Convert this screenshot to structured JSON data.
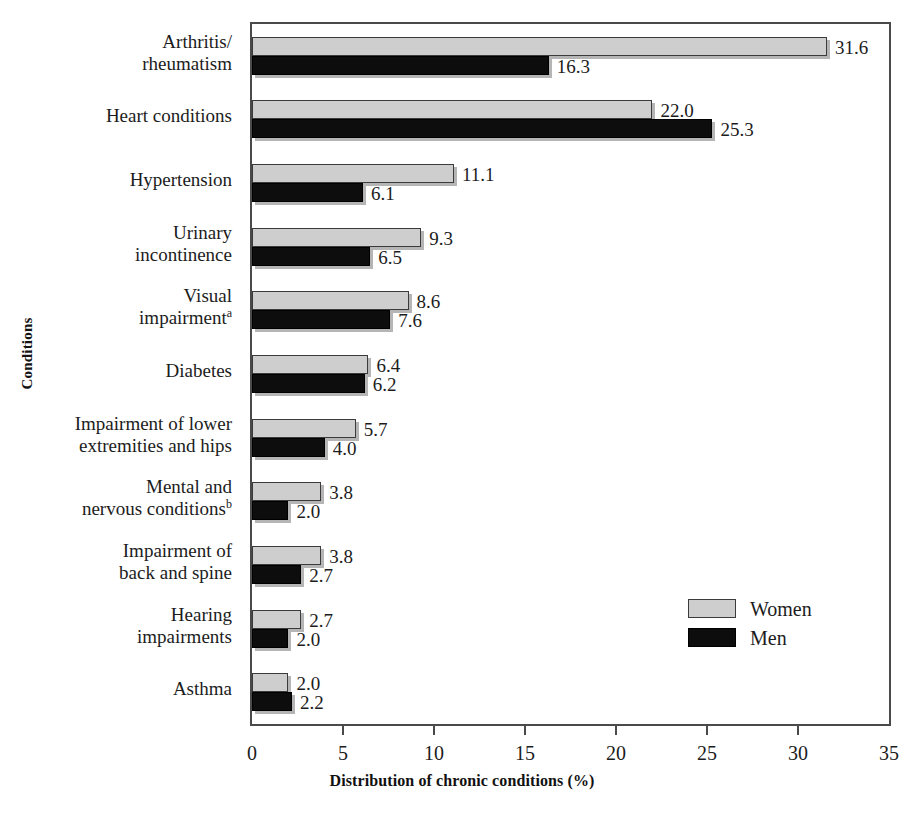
{
  "chart_data": {
    "type": "bar",
    "orientation": "horizontal",
    "title": "",
    "xlabel": "Distribution of chronic conditions (%)",
    "ylabel": "Conditions",
    "xlim": [
      0,
      35
    ],
    "xticks": [
      "0",
      "5",
      "10",
      "15",
      "20",
      "25",
      "30",
      "35"
    ],
    "grid": false,
    "legend_position": "middle-right",
    "categories": [
      "Arthritis/\nrheumatism",
      "Heart conditions",
      "Hypertension",
      "Urinary\nincontinence",
      "Visual\nimpairment",
      "Diabetes",
      "Impairment of lower\nextremities and hips",
      "Mental and\nnervous conditions",
      "Impairment of\nback and spine",
      "Hearing\nimpairments",
      "Asthma"
    ],
    "category_superscripts": [
      "",
      "",
      "",
      "",
      "a",
      "",
      "",
      "b",
      "",
      "",
      ""
    ],
    "series": [
      {
        "name": "Women",
        "color": "#cecece",
        "values": [
          31.6,
          22.0,
          11.1,
          9.3,
          8.6,
          6.4,
          5.7,
          3.8,
          3.8,
          2.7,
          2.0
        ],
        "labels": [
          "31.6",
          "22.0",
          "11.1",
          "9.3",
          "8.6",
          "6.4",
          "5.7",
          "3.8",
          "3.8",
          "2.7",
          "2.0"
        ]
      },
      {
        "name": "Men",
        "color": "#0d0d0d",
        "values": [
          16.3,
          25.3,
          6.1,
          6.5,
          7.6,
          6.2,
          4.0,
          2.0,
          2.7,
          2.0,
          2.2
        ],
        "labels": [
          "16.3",
          "25.3",
          "6.1",
          "6.5",
          "7.6",
          "6.2",
          "4.0",
          "2.0",
          "2.7",
          "2.0",
          "2.2"
        ]
      }
    ]
  },
  "legend": {
    "items": [
      {
        "label": "Women",
        "swatch": "women"
      },
      {
        "label": "Men",
        "swatch": "men"
      }
    ]
  }
}
